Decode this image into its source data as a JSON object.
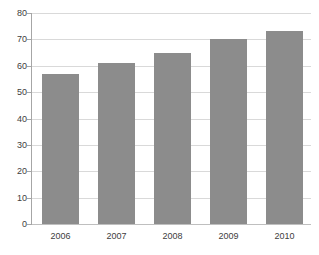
{
  "chart_data": {
    "type": "bar",
    "title": "",
    "subtitle": "",
    "xlabel": "",
    "ylabel": "",
    "categories": [
      "2006",
      "2007",
      "2008",
      "2009",
      "2010"
    ],
    "values": [
      57,
      61,
      65,
      70,
      73
    ],
    "series": [
      {
        "name": "",
        "values": [
          57,
          61,
          65,
          70,
          73
        ]
      }
    ],
    "ylim": [
      0,
      80
    ],
    "y_ticks": [
      0,
      10,
      20,
      30,
      40,
      50,
      60,
      70,
      80
    ],
    "y_tick_labels": [
      "0",
      "10",
      "20",
      "30",
      "40",
      "50",
      "60",
      "70",
      "80"
    ],
    "grid": "horizontal",
    "legend": "none",
    "annotations": [],
    "colors": {
      "bar_fill": "#8c8c8c",
      "gridline": "#d9d9d9",
      "axis_line": "#a6a6a6",
      "baseline": "#bfbfbf",
      "tick_label": "#404040",
      "background": "#ffffff"
    }
  }
}
